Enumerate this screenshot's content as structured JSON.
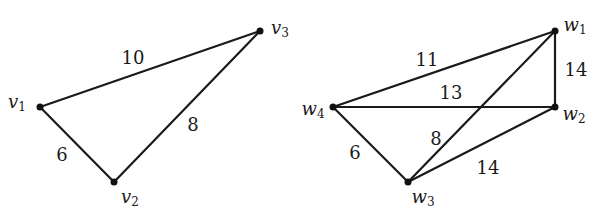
{
  "graphs": [
    {
      "id": "G",
      "vertices": [
        {
          "id": "v1",
          "name": "v",
          "sub": "1",
          "x": 40,
          "y": 107,
          "label_x": 17,
          "label_y": 103
        },
        {
          "id": "v2",
          "name": "v",
          "sub": "2",
          "x": 114,
          "y": 182,
          "label_x": 130,
          "label_y": 198
        },
        {
          "id": "v3",
          "name": "v",
          "sub": "3",
          "x": 260,
          "y": 31,
          "label_x": 280,
          "label_y": 29
        }
      ],
      "edges": [
        {
          "from": "v1",
          "to": "v3",
          "weight": "10",
          "label_x": 133,
          "label_y": 58
        },
        {
          "from": "v1",
          "to": "v2",
          "weight": "6",
          "label_x": 62,
          "label_y": 155
        },
        {
          "from": "v2",
          "to": "v3",
          "weight": "8",
          "label_x": 193,
          "label_y": 125
        }
      ]
    },
    {
      "id": "H",
      "vertices": [
        {
          "id": "w1",
          "name": "w",
          "sub": "1",
          "x": 555,
          "y": 31,
          "label_x": 575,
          "label_y": 26
        },
        {
          "id": "w2",
          "name": "w",
          "sub": "2",
          "x": 555,
          "y": 107,
          "label_x": 574,
          "label_y": 115
        },
        {
          "id": "w3",
          "name": "w",
          "sub": "3",
          "x": 408,
          "y": 182,
          "label_x": 423,
          "label_y": 198
        },
        {
          "id": "w4",
          "name": "w",
          "sub": "4",
          "x": 333,
          "y": 107,
          "label_x": 313,
          "label_y": 110
        }
      ],
      "edges": [
        {
          "from": "w4",
          "to": "w1",
          "weight": "11",
          "label_x": 427,
          "label_y": 60
        },
        {
          "from": "w4",
          "to": "w2",
          "weight": "13",
          "label_x": 451,
          "label_y": 93
        },
        {
          "from": "w1",
          "to": "w2",
          "weight": "14",
          "label_x": 576,
          "label_y": 70
        },
        {
          "from": "w3",
          "to": "w1",
          "weight": "8",
          "label_x": 436,
          "label_y": 139
        },
        {
          "from": "w4",
          "to": "w3",
          "weight": "6",
          "label_x": 355,
          "label_y": 153
        },
        {
          "from": "w3",
          "to": "w2",
          "weight": "14",
          "label_x": 488,
          "label_y": 168
        }
      ]
    }
  ],
  "colors": {
    "stroke": "#1a1a1a",
    "node": "#111111",
    "background": "#ffffff"
  }
}
